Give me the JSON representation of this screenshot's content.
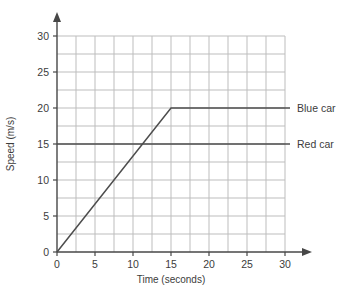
{
  "chart_data": {
    "type": "line",
    "title": "",
    "xlabel": "Time (seconds)",
    "ylabel": "Speed (m/s)",
    "xlim": [
      0,
      30
    ],
    "ylim": [
      0,
      30
    ],
    "xticks": [
      0,
      5,
      10,
      15,
      20,
      25,
      30
    ],
    "yticks": [
      0,
      5,
      10,
      15,
      20,
      25,
      30
    ],
    "grid": true,
    "grid_step": 2.5,
    "legend_position": "right-of-line",
    "series": [
      {
        "name": "Blue car",
        "x": [
          0,
          15,
          30
        ],
        "y": [
          0,
          20,
          20
        ]
      },
      {
        "name": "Red car",
        "x": [
          0,
          30
        ],
        "y": [
          15,
          15
        ]
      }
    ],
    "colors": {
      "line": "#4d4d4d",
      "grid": "#bdbdbd",
      "axis": "#474747",
      "text": "#3c3c3c",
      "background": "#ffffff"
    }
  }
}
